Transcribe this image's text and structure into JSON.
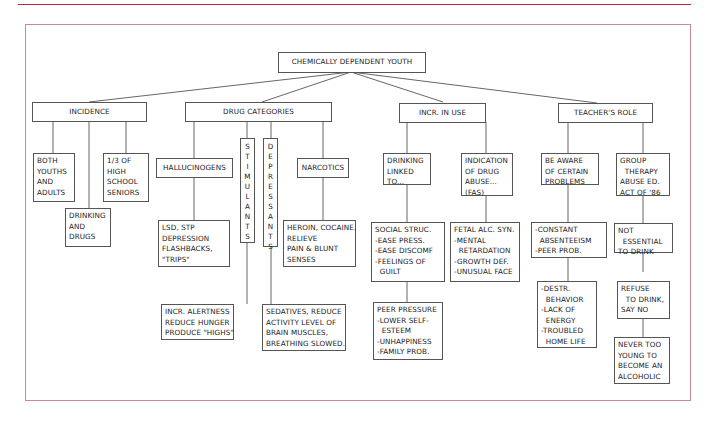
{
  "diagram": {
    "root": "CHEMICALLY DEPENDENT YOUTH",
    "branches": {
      "incidence": {
        "label": "INCIDENCE",
        "items": [
          "BOTH\nYOUTHS\nAND\nADULTS",
          "DRINKING\nAND\nDRUGS",
          "1/3 OF\nHIGH\nSCHOOL\nSENIORS"
        ]
      },
      "drug_categories": {
        "label": "DRUG CATEGORIES",
        "hallucinogens": "HALLUCINOGENS",
        "hallucinogens_detail": "LSD, STP\nDEPRESSION\nFLASHBACKS,\n\"TRIPS\"",
        "stimulants": "STIMULANTS",
        "stimulants_detail": "INCR. ALERTNESS\nREDUCE HUNGER\nPRODUCE \"HIGHS\"",
        "depressants": "DEPRESSANTS",
        "depressants_detail": "SEDATIVES, REDUCE\nACTIVITY LEVEL OF\nBRAIN MUSCLES,\nBREATHING SLOWED.",
        "narcotics": "NARCOTICS",
        "narcotics_detail": "HEROIN, COCAINE.\nRELIEVE\nPAIN & BLUNT\nSENSES"
      },
      "incr_in_use": {
        "label": "INCR. IN USE",
        "drinking_linked": "DRINKING\nLINKED\nTO...",
        "social": "SOCIAL STRUC.\n-EASE PRESS.\n-EASE DISCOMF\n-FEELINGS OF\n  GUILT",
        "peer": "PEER PRESSURE\n-LOWER SELF-\n  ESTEEM\n-UNHAPPINESS\n-FAMILY PROB.",
        "indication": "INDICATION\nOF DRUG\nABUSE...\n(FAS)",
        "fetal": "FETAL ALC. SYN.\n-MENTAL\n  RETARDATION\n-GROWTH DEF.\n-UNUSUAL FACE"
      },
      "teachers_role": {
        "label": "TEACHER'S ROLE",
        "be_aware": "BE AWARE\nOF CERTAIN\nPROBLEMS",
        "absenteeism": "-CONSTANT\n  ABSENTEEISM\n-PEER PROB.",
        "destr": "-DESTR.\n  BEHAVIOR\n-LACK OF\n  ENERGY\n-TROUBLED\n  HOME LIFE",
        "group": "GROUP\n  THERAPY\nABUSE ED.\nACT OF '86",
        "not_essential": "NOT\n  ESSENTIAL\nTO DRINK",
        "refuse": "REFUSE\n  TO DRINK,\nSAY NO",
        "never": "NEVER TOO\nYOUNG TO\nBECOME AN\nALCOHOLIC"
      }
    }
  },
  "colors": {
    "top_rule": "#b22a3a",
    "frame": "#c98a93",
    "box_border": "#555555",
    "text": "#222222"
  }
}
